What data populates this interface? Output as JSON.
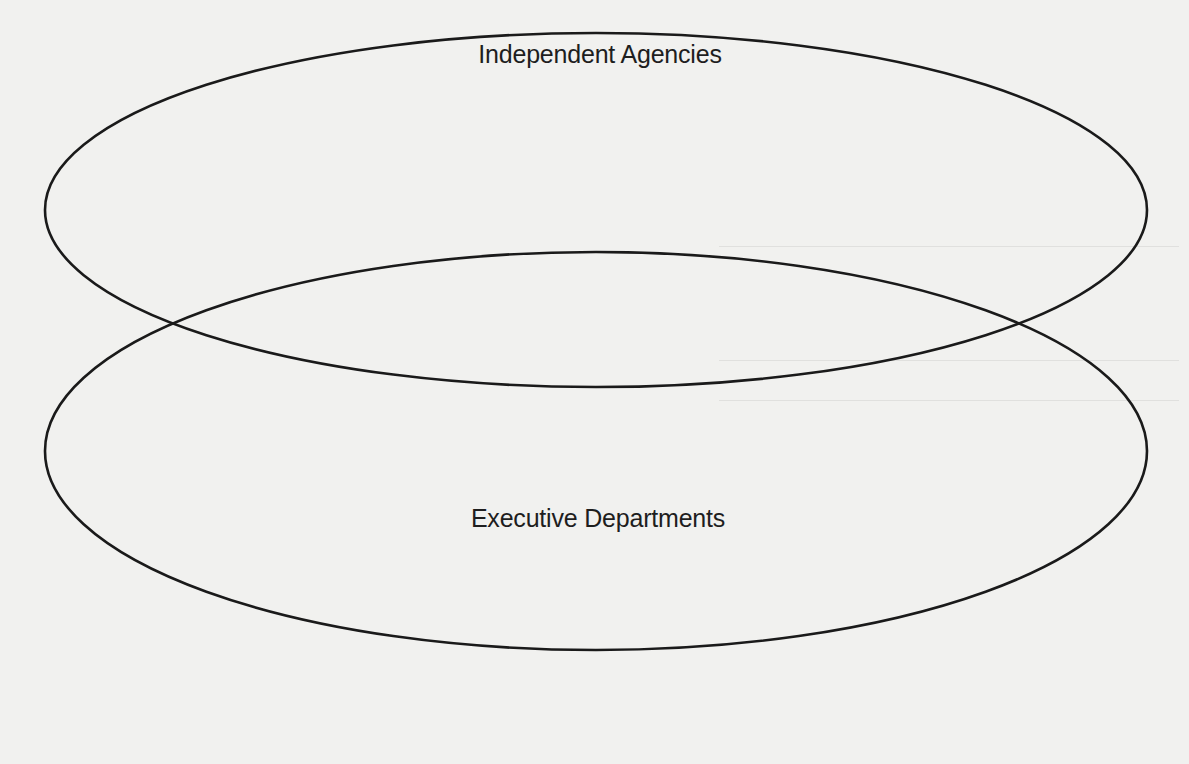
{
  "diagram": {
    "type": "venn",
    "sets": [
      {
        "id": "independent-agencies",
        "label": "Independent Agencies",
        "shape": "ellipse",
        "cx": 596,
        "cy": 210,
        "rx": 551,
        "ry": 177
      },
      {
        "id": "executive-departments",
        "label": "Executive Departments",
        "shape": "ellipse",
        "cx": 596,
        "cy": 451,
        "rx": 551,
        "ry": 199
      }
    ],
    "stroke_color": "#1a1a1a",
    "background_color": "#f1f1ef"
  },
  "labels": {
    "top": "Independent Agencies",
    "bottom": "Executive Departments"
  }
}
